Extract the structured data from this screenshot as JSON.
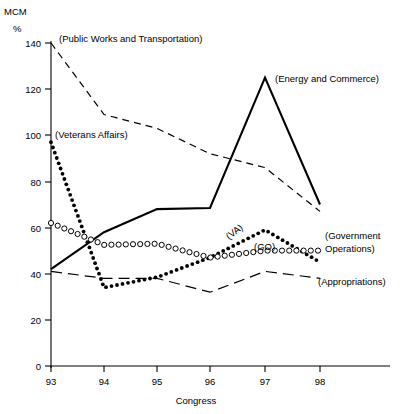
{
  "chart_data": {
    "type": "line",
    "title": "",
    "subtitle": "",
    "ylabel_top": "MCM",
    "ylabel_unit": "%",
    "xlabel": "Congress",
    "x": [
      93,
      94,
      95,
      96,
      97,
      98
    ],
    "xticklabels": [
      "93",
      "94",
      "95",
      "96",
      "97",
      "98"
    ],
    "yticklabels": [
      "0",
      "20",
      "40",
      "60",
      "80",
      "100",
      "120",
      "140"
    ],
    "yticks": [
      0,
      20,
      40,
      60,
      80,
      100,
      120,
      140
    ],
    "xlim": [
      93,
      98
    ],
    "ylim": [
      0,
      140
    ],
    "grid": false,
    "legend_position": "inline-annotations",
    "series": [
      {
        "name": "Public Works and Transportation",
        "label": "(Public Works and Transportation)",
        "style": "dashed",
        "marker": "none",
        "color": "#000000",
        "values": [
          140,
          109,
          103,
          92,
          86,
          67
        ]
      },
      {
        "name": "Energy and Commerce",
        "label": "(Energy and Commerce)",
        "style": "solid",
        "marker": "none",
        "color": "#000000",
        "values": [
          42,
          58,
          68,
          68.5,
          125,
          70
        ]
      },
      {
        "name": "Veterans Affairs",
        "label": "(Veterans Affairs)",
        "inline_label": "(VA)",
        "style": "dotted",
        "marker": "filled-dot",
        "color": "#000000",
        "values": [
          97,
          34,
          38.5,
          47,
          59,
          45
        ]
      },
      {
        "name": "Government Operations",
        "label": "(Government Operations)",
        "label_line1": "(Government",
        "label_line2": "Operations)",
        "inline_label": "(GO)",
        "style": "dotted",
        "marker": "open-circle",
        "color": "#000000",
        "values": [
          62,
          52.5,
          53,
          47,
          50,
          50
        ]
      },
      {
        "name": "Appropriations",
        "label": "(Appropriations)",
        "style": "long-dash",
        "marker": "none",
        "color": "#000000",
        "values": [
          41,
          38,
          38,
          32,
          41,
          38
        ]
      }
    ]
  },
  "labels": {
    "mcm": "MCM",
    "percent": "%",
    "congress": "Congress",
    "public_works": "(Public Works and Transportation)",
    "energy_commerce": "(Energy and Commerce)",
    "veterans_affairs": "(Veterans Affairs)",
    "government_operations_line1": "(Government",
    "government_operations_line2": "Operations)",
    "appropriations": "(Appropriations)",
    "va_inline": "(VA)",
    "go_inline": "(GO)"
  },
  "axis": {
    "y_ticks": [
      "140",
      "120",
      "100",
      "80",
      "60",
      "40",
      "20",
      "0"
    ],
    "x_ticks": [
      "93",
      "94",
      "95",
      "96",
      "97",
      "98"
    ]
  },
  "colors": {
    "ink": "#000000",
    "background": "#ffffff"
  }
}
